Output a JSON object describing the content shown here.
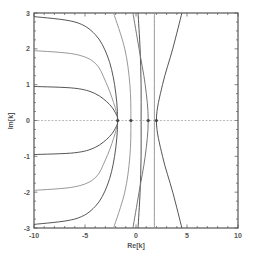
{
  "chart_data": {
    "type": "line",
    "title": "",
    "xlabel": "Re[k]",
    "ylabel": "Im[k]",
    "xlim": [
      -10,
      10
    ],
    "ylim": [
      -3,
      3
    ],
    "grid": false,
    "legend": null,
    "x_ticks": [
      -10,
      -5,
      0,
      5,
      10
    ],
    "y_ticks": [
      -3,
      -2,
      -1,
      0,
      1,
      2,
      3
    ],
    "x_tick_labels": [
      "-10",
      "-5",
      "0",
      "5",
      "10"
    ],
    "y_tick_labels": [
      "-3",
      "-2",
      "-1",
      "0",
      "1",
      "2",
      "3"
    ],
    "reference_line": {
      "orientation": "horizontal",
      "y": 0,
      "style": "dashed"
    },
    "real_axis_crossings": [
      -1.8,
      -0.5,
      1.2,
      2.0
    ],
    "series": [
      {
        "name": "curve-1",
        "color": "#555555",
        "points": [
          [
            -10,
            2.9
          ],
          [
            -6,
            2.75
          ],
          [
            -4,
            2.4
          ],
          [
            -2.8,
            1.8
          ],
          [
            -2.1,
            1.0
          ],
          [
            -1.8,
            0
          ],
          [
            -2.1,
            -1.0
          ],
          [
            -2.8,
            -1.8
          ],
          [
            -4,
            -2.4
          ],
          [
            -6,
            -2.75
          ],
          [
            -10,
            -2.9
          ]
        ]
      },
      {
        "name": "curve-2",
        "color": "#999999",
        "points": [
          [
            -10,
            1.95
          ],
          [
            -6,
            1.85
          ],
          [
            -4,
            1.6
          ],
          [
            -3,
            1.1
          ],
          [
            -2.2,
            0.5
          ],
          [
            -1.8,
            0
          ],
          [
            -2.2,
            -0.5
          ],
          [
            -3,
            -1.1
          ],
          [
            -4,
            -1.6
          ],
          [
            -6,
            -1.85
          ],
          [
            -10,
            -1.95
          ]
        ]
      },
      {
        "name": "curve-3",
        "color": "#555555",
        "points": [
          [
            -10,
            0.95
          ],
          [
            -6,
            0.9
          ],
          [
            -4,
            0.75
          ],
          [
            -2.6,
            0.45
          ],
          [
            -1.9,
            0.15
          ],
          [
            -1.8,
            0
          ],
          [
            -1.9,
            -0.15
          ],
          [
            -2.6,
            -0.45
          ],
          [
            -4,
            -0.75
          ],
          [
            -6,
            -0.9
          ],
          [
            -10,
            -0.95
          ]
        ]
      },
      {
        "name": "curve-4",
        "color": "#999999",
        "points": [
          [
            -2.2,
            3
          ],
          [
            -1.1,
            2
          ],
          [
            -0.6,
            1
          ],
          [
            -0.5,
            0
          ],
          [
            -0.6,
            -1
          ],
          [
            -1.1,
            -2
          ],
          [
            -2.2,
            -3
          ]
        ]
      },
      {
        "name": "curve-5",
        "color": "#555555",
        "points": [
          [
            0.2,
            3
          ],
          [
            0.4,
            2
          ],
          [
            0.5,
            1
          ],
          [
            0.5,
            0
          ],
          [
            0.5,
            -1
          ],
          [
            0.4,
            -2
          ],
          [
            0.2,
            -3
          ]
        ]
      },
      {
        "name": "curve-6",
        "color": "#777777",
        "points": [
          [
            -0.3,
            3
          ],
          [
            0.3,
            2
          ],
          [
            0.9,
            1
          ],
          [
            1.2,
            0
          ],
          [
            0.9,
            -1
          ],
          [
            0.3,
            -2
          ],
          [
            -0.3,
            -3
          ]
        ]
      },
      {
        "name": "curve-7",
        "color": "#999999",
        "points": [
          [
            1.8,
            3
          ],
          [
            1.8,
            2
          ],
          [
            1.8,
            1
          ],
          [
            1.8,
            0
          ],
          [
            1.8,
            -1
          ],
          [
            1.8,
            -2
          ],
          [
            1.8,
            -3
          ]
        ]
      },
      {
        "name": "curve-8",
        "color": "#555555",
        "points": [
          [
            4.5,
            3
          ],
          [
            3.6,
            2
          ],
          [
            2.6,
            1
          ],
          [
            2.0,
            0
          ],
          [
            2.6,
            -1
          ],
          [
            3.6,
            -2
          ],
          [
            4.5,
            -3
          ]
        ]
      }
    ]
  }
}
